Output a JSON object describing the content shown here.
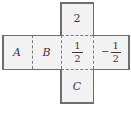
{
  "figure": {
    "type": "cube-net-cross",
    "fill_color": "#f2f2f2",
    "outline_color": "#6e6e6e",
    "divider_color": "#7a7a7a",
    "text_color": "#3b3b3b",
    "background_color": "#ffffff"
  },
  "cells": {
    "top": {
      "name": "top",
      "kind": "number",
      "text": "2"
    },
    "left_outer": {
      "name": "left-outer",
      "kind": "variable",
      "text": "A"
    },
    "left_inner": {
      "name": "left-inner",
      "kind": "variable",
      "text": "B"
    },
    "center": {
      "name": "center",
      "kind": "fraction",
      "sign": "",
      "numerator": "1",
      "denominator": "2"
    },
    "right_outer": {
      "name": "right-outer",
      "kind": "fraction",
      "sign": "−",
      "numerator": "1",
      "denominator": "2"
    },
    "bottom": {
      "name": "bottom",
      "kind": "variable",
      "text": "C"
    }
  }
}
